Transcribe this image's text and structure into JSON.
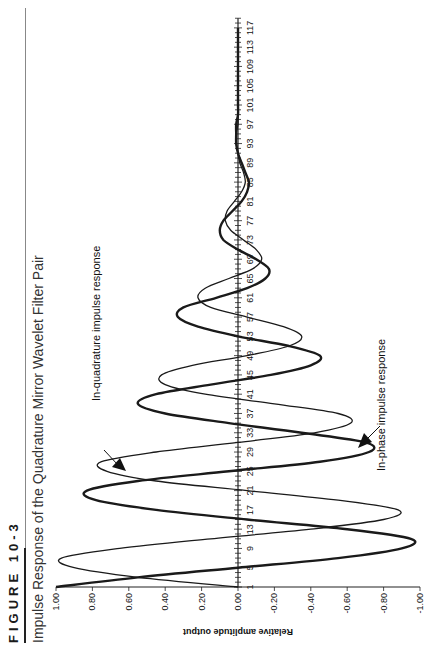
{
  "figure": {
    "label": "FIGURE 10-3",
    "title": "Impulse Response of the Quadrature Mirror Wavelet Filter Pair"
  },
  "annotations": {
    "in_quadrature": "In-quadrature impulse response",
    "in_phase": "In-phase impulse response"
  },
  "axes": {
    "ylabel": "Relative amplitude output",
    "yticks": [
      "1.00",
      "0.80",
      "0.60",
      "0.40",
      "0.20",
      "0.00",
      "-0.20",
      "-0.40",
      "-0.60",
      "-0.80",
      "-1.00"
    ],
    "xticks": [
      "1",
      "5",
      "9",
      "13",
      "17",
      "21",
      "25",
      "29",
      "33",
      "37",
      "41",
      "45",
      "49",
      "53",
      "57",
      "61",
      "65",
      "69",
      "73",
      "77",
      "81",
      "85",
      "89",
      "93",
      "97",
      "101",
      "105",
      "109",
      "113",
      "117"
    ]
  },
  "colors": {
    "line": "#1a1a1a",
    "axis": "#222222"
  },
  "chart_data": {
    "type": "line",
    "title": "Impulse Response of the Quadrature Mirror Wavelet Filter Pair",
    "subtitle": "FIGURE 10-3",
    "xlabel": "",
    "ylabel": "Relative amplitude output",
    "xlim": [
      1,
      119
    ],
    "ylim": [
      -1.0,
      1.0
    ],
    "grid": false,
    "legend_position": "annotations",
    "x": [
      1,
      3,
      5,
      7,
      9,
      11,
      13,
      15,
      17,
      19,
      21,
      23,
      25,
      27,
      29,
      31,
      33,
      35,
      37,
      39,
      41,
      43,
      45,
      47,
      49,
      51,
      53,
      55,
      57,
      59,
      61,
      63,
      65,
      67,
      69,
      71,
      73,
      75,
      77,
      79,
      81,
      83,
      85,
      87,
      89,
      91,
      93,
      95,
      97,
      99,
      101,
      103,
      105,
      107,
      109,
      111,
      113,
      115,
      117
    ],
    "series": [
      {
        "name": "In-phase impulse response",
        "style": "thick",
        "values": [
          1.0,
          0.55,
          0.0,
          -0.55,
          -0.9,
          -0.95,
          -0.6,
          -0.05,
          0.45,
          0.78,
          0.83,
          0.55,
          0.05,
          -0.45,
          -0.72,
          -0.7,
          -0.35,
          0.05,
          0.4,
          0.55,
          0.45,
          0.15,
          -0.18,
          -0.4,
          -0.45,
          -0.28,
          0.0,
          0.22,
          0.33,
          0.3,
          0.12,
          -0.05,
          -0.15,
          -0.17,
          -0.1,
          0.0,
          0.08,
          0.1,
          0.08,
          0.03,
          -0.02,
          -0.05,
          -0.06,
          -0.04,
          -0.02,
          0.0,
          0.01,
          0.01,
          0.01,
          0.0,
          0.0,
          0.0,
          0.0,
          0.0,
          0.0,
          0.0,
          0.0,
          0.0,
          0.0
        ]
      },
      {
        "name": "In-quadrature impulse response",
        "style": "thin",
        "values": [
          0.0,
          0.55,
          0.9,
          0.97,
          0.65,
          0.15,
          -0.4,
          -0.8,
          -0.88,
          -0.55,
          -0.05,
          0.45,
          0.72,
          0.75,
          0.45,
          0.0,
          -0.42,
          -0.62,
          -0.55,
          -0.2,
          0.18,
          0.4,
          0.42,
          0.25,
          -0.05,
          -0.28,
          -0.35,
          -0.25,
          -0.05,
          0.15,
          0.22,
          0.18,
          0.05,
          -0.08,
          -0.13,
          -0.1,
          -0.03,
          0.04,
          0.07,
          0.06,
          0.02,
          -0.02,
          -0.04,
          -0.03,
          -0.01,
          0.0,
          0.01,
          0.01,
          0.0,
          0.0,
          0.0,
          0.0,
          0.0,
          0.0,
          0.0,
          0.0,
          0.0,
          0.0,
          0.0
        ]
      }
    ]
  }
}
